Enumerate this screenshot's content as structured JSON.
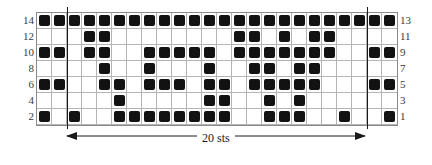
{
  "chart_data": {
    "type": "heatmap",
    "title": "",
    "xlabel": "20 sts",
    "ylabel": "",
    "columns": 24,
    "rows": 7,
    "cell_on_color": "#121212",
    "cell_off_color": "#ffffff",
    "grid": true,
    "legend_position": "none",
    "row_labels_left": [
      "14",
      "12",
      "10",
      "8",
      "6",
      "4",
      "2"
    ],
    "row_labels_right": [
      "13",
      "11",
      "9",
      "7",
      "5",
      "3",
      "1"
    ],
    "repeat_start_column": 2,
    "repeat_end_column": 22,
    "repeat_width_label": "20 sts",
    "cells": [
      [
        1,
        1,
        1,
        1,
        1,
        1,
        1,
        1,
        1,
        1,
        1,
        1,
        1,
        1,
        1,
        1,
        1,
        1,
        1,
        1,
        1,
        1,
        1,
        1
      ],
      [
        0,
        0,
        0,
        1,
        1,
        0,
        0,
        0,
        0,
        0,
        0,
        0,
        0,
        1,
        1,
        0,
        1,
        0,
        1,
        1,
        0,
        0,
        0,
        0
      ],
      [
        1,
        1,
        0,
        1,
        1,
        0,
        0,
        1,
        1,
        1,
        1,
        1,
        0,
        1,
        1,
        1,
        1,
        1,
        1,
        1,
        0,
        0,
        1,
        1
      ],
      [
        0,
        0,
        0,
        0,
        1,
        0,
        0,
        1,
        0,
        0,
        0,
        1,
        0,
        0,
        1,
        1,
        0,
        1,
        1,
        0,
        0,
        0,
        0,
        0
      ],
      [
        1,
        1,
        0,
        0,
        1,
        1,
        0,
        1,
        1,
        1,
        0,
        1,
        1,
        0,
        1,
        1,
        1,
        1,
        1,
        0,
        0,
        0,
        1,
        1
      ],
      [
        0,
        0,
        0,
        0,
        0,
        1,
        0,
        0,
        0,
        0,
        0,
        1,
        1,
        0,
        0,
        1,
        0,
        1,
        0,
        0,
        0,
        0,
        0,
        0
      ],
      [
        1,
        0,
        1,
        0,
        0,
        1,
        1,
        1,
        1,
        1,
        1,
        1,
        1,
        0,
        0,
        1,
        1,
        1,
        0,
        0,
        1,
        0,
        0,
        1
      ]
    ]
  }
}
